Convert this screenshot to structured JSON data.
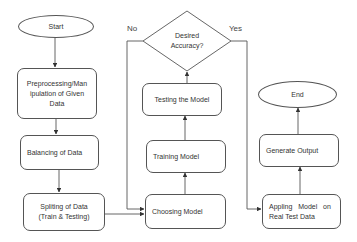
{
  "diagram": {
    "type": "flowchart",
    "nodes": {
      "start": "Start",
      "preprocessing": "Preprocessing/Manipulation of Given Data",
      "preprocessing_line1": "Preprocessing/Man",
      "preprocessing_line2": "ipulation of Given",
      "preprocessing_line3": "Data",
      "balancing": "Balancing of Data",
      "splitting_line1": "Spliting of Data",
      "splitting_line2": "(Train & Testing)",
      "choosing": "Choosing Model",
      "training": "Training Model",
      "testing": "Testing the Model",
      "decision_line1": "Desired",
      "decision_line2": "Accuracy?",
      "applying_line1": "Appling   Model   on",
      "applying_line2": "Real Test Data",
      "generate": "Generate Output",
      "end": "End"
    },
    "edge_labels": {
      "no": "No",
      "yes": "Yes"
    },
    "edges": [
      {
        "from": "Start",
        "to": "Preprocessing/Manipulation of Given Data"
      },
      {
        "from": "Preprocessing/Manipulation of Given Data",
        "to": "Balancing of Data"
      },
      {
        "from": "Balancing of Data",
        "to": "Spliting of Data (Train & Testing)"
      },
      {
        "from": "Spliting of Data (Train & Testing)",
        "to": "Choosing Model"
      },
      {
        "from": "Choosing Model",
        "to": "Training Model"
      },
      {
        "from": "Training Model",
        "to": "Testing the Model"
      },
      {
        "from": "Testing the Model",
        "to": "Desired Accuracy?"
      },
      {
        "from": "Desired Accuracy?",
        "to": "Choosing Model",
        "label": "No"
      },
      {
        "from": "Desired Accuracy?",
        "to": "Appling Model on Real Test Data",
        "label": "Yes"
      },
      {
        "from": "Appling Model on Real Test Data",
        "to": "Generate Output"
      },
      {
        "from": "Generate Output",
        "to": "End"
      }
    ]
  },
  "colors": {
    "stroke": "#555555",
    "text": "#333333",
    "background": "#ffffff"
  }
}
